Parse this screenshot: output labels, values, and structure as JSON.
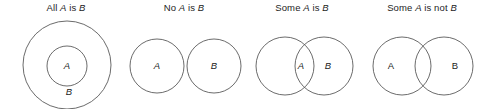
{
  "figure": {
    "background_color": "#ffffff",
    "stroke_color": "#5a5a5a",
    "text_color": "#1d1d1d",
    "panel_count": 4
  },
  "panels": [
    {
      "id": "all-a-is-b",
      "title_prefix": "All ",
      "title_var1": "A",
      "title_mid": " is ",
      "title_var2": "B",
      "relation": "subset",
      "labels": {
        "a": "A",
        "b": "B"
      },
      "label_style": "italic"
    },
    {
      "id": "no-a-is-b",
      "title_prefix": "No ",
      "title_var1": "A",
      "title_mid": " is ",
      "title_var2": "B",
      "relation": "disjoint",
      "labels": {
        "a": "A",
        "b": "B"
      },
      "label_style": "italic"
    },
    {
      "id": "some-a-is-b",
      "title_prefix": "Some ",
      "title_var1": "A",
      "title_mid": " is ",
      "title_var2": "B",
      "relation": "overlap-label-in-intersection",
      "labels": {
        "a": "A",
        "b": "B"
      },
      "label_style": "italic"
    },
    {
      "id": "some-a-is-not-b",
      "title_prefix": "Some ",
      "title_var1": "A",
      "title_mid": " is not ",
      "title_var2": "B",
      "relation": "overlap-labels-outside-intersection",
      "labels": {
        "a": "A",
        "b": "B"
      },
      "label_style": "roman"
    }
  ]
}
